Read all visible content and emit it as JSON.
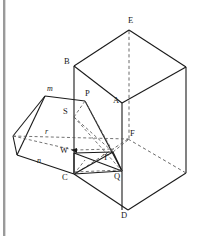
{
  "figure": {
    "kind": "geometry-line-drawing",
    "background_color": "#ffffff",
    "line_color": "#1a1a1a",
    "dashed_line_color": "#555555",
    "scan_edge_color": "#9a9a9a",
    "labels": [
      {
        "text": "E",
        "x": 130,
        "y": 20,
        "style": "upright"
      },
      {
        "text": "B",
        "x": 67,
        "y": 61,
        "style": "upright"
      },
      {
        "text": "A",
        "x": 114,
        "y": 100,
        "style": "upright"
      },
      {
        "text": "F",
        "x": 131,
        "y": 133,
        "style": "upright"
      },
      {
        "text": "D",
        "x": 122,
        "y": 214,
        "style": "upright"
      },
      {
        "text": "C",
        "x": 63,
        "y": 172,
        "style": "upright"
      },
      {
        "text": "Q",
        "x": 115,
        "y": 172,
        "style": "upright"
      },
      {
        "text": "P",
        "x": 86,
        "y": 93,
        "style": "upright"
      },
      {
        "text": "S",
        "x": 64,
        "y": 109,
        "style": "upright"
      },
      {
        "text": "T",
        "x": 103,
        "y": 155,
        "style": "upright"
      },
      {
        "text": "W",
        "x": 62,
        "y": 148,
        "style": "upright"
      },
      {
        "text": "m",
        "x": 47,
        "y": 88,
        "style": "italic"
      },
      {
        "text": "r",
        "x": 45,
        "y": 131,
        "style": "italic"
      },
      {
        "text": "n",
        "x": 37,
        "y": 159,
        "style": "italic"
      }
    ],
    "vertices": {
      "E": [
        129,
        30
      ],
      "B": [
        74,
        66
      ],
      "A": [
        122,
        103
      ],
      "F": [
        128,
        139
      ],
      "D": [
        128,
        210
      ],
      "C": [
        74,
        174
      ],
      "Q": [
        122,
        171
      ],
      "P": [
        85,
        101
      ],
      "S": [
        74,
        117
      ],
      "T": [
        113,
        152
      ],
      "W": [
        74,
        153
      ],
      "m": [
        45,
        96
      ],
      "L1": [
        13,
        136
      ],
      "L2": [
        17,
        155
      ]
    },
    "prism": {
      "name": "rectangular-prism",
      "top_face": [
        "B",
        "E",
        "right-back",
        "A"
      ],
      "front_vertical_edge": [
        "A",
        "D"
      ],
      "hidden_edges_dashed": [
        "E-F",
        "F-C-hidden",
        "F-right-bottom"
      ]
    },
    "wedge": {
      "name": "wedge-solid",
      "apex_label": "m",
      "base_labels": [
        "n",
        "r"
      ],
      "interior_points": [
        "S",
        "W",
        "T",
        "P",
        "Q",
        "C"
      ]
    }
  }
}
